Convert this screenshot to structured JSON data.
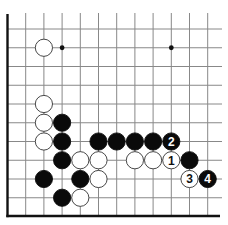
{
  "diagram": {
    "type": "go-board-fragment",
    "grid": {
      "columns": 12,
      "rows": 11,
      "origin_x": 7.5,
      "origin_y": 29,
      "spacing_x": 18.2,
      "spacing_y": 18.75,
      "line_color": "#888888",
      "edge_color": "#111111",
      "edges": [
        "left",
        "bottom"
      ]
    },
    "star_points": [
      {
        "col": 3,
        "row": 1
      },
      {
        "col": 9,
        "row": 1
      }
    ],
    "stones": [
      {
        "color": "white",
        "col": 2,
        "row": 1
      },
      {
        "color": "white",
        "col": 2,
        "row": 4
      },
      {
        "color": "white",
        "col": 2,
        "row": 5
      },
      {
        "color": "black",
        "col": 3,
        "row": 5
      },
      {
        "color": "white",
        "col": 2,
        "row": 6
      },
      {
        "color": "black",
        "col": 3,
        "row": 6
      },
      {
        "color": "black",
        "col": 5,
        "row": 6
      },
      {
        "color": "black",
        "col": 6,
        "row": 6
      },
      {
        "color": "black",
        "col": 7,
        "row": 6
      },
      {
        "color": "black",
        "col": 8,
        "row": 6
      },
      {
        "color": "black",
        "col": 9,
        "row": 6,
        "label": "2"
      },
      {
        "color": "black",
        "col": 3,
        "row": 7
      },
      {
        "color": "white",
        "col": 4,
        "row": 7
      },
      {
        "color": "white",
        "col": 5,
        "row": 7
      },
      {
        "color": "white",
        "col": 7,
        "row": 7
      },
      {
        "color": "white",
        "col": 8,
        "row": 7
      },
      {
        "color": "white",
        "col": 9,
        "row": 7,
        "label": "1"
      },
      {
        "color": "black",
        "col": 10,
        "row": 7
      },
      {
        "color": "black",
        "col": 2,
        "row": 8
      },
      {
        "color": "black",
        "col": 4,
        "row": 8
      },
      {
        "color": "white",
        "col": 5,
        "row": 8
      },
      {
        "color": "white",
        "col": 10,
        "row": 8,
        "label": "3"
      },
      {
        "color": "black",
        "col": 11,
        "row": 8,
        "label": "4"
      },
      {
        "color": "black",
        "col": 3,
        "row": 9
      },
      {
        "color": "white",
        "col": 4,
        "row": 9
      }
    ],
    "move_labels": [
      "1",
      "2",
      "3",
      "4"
    ]
  }
}
